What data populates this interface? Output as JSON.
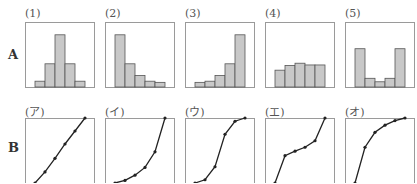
{
  "rows": [
    {
      "label": "A",
      "type": "histogram"
    },
    {
      "label": "B",
      "type": "line"
    }
  ],
  "colors": {
    "frame": "#9a9a9a",
    "bar_fill": "#c8c8c8",
    "bar_stroke": "#555555",
    "line": "#222222"
  },
  "chart_data": [
    {
      "type": "bar",
      "title": "(1)",
      "row": "A",
      "values": [
        1,
        4,
        9,
        4,
        1
      ],
      "ylim": [
        0,
        10
      ],
      "note": "symmetric, single peak"
    },
    {
      "type": "bar",
      "title": "(2)",
      "row": "A",
      "values": [
        9,
        4,
        2,
        1,
        0.8
      ],
      "ylim": [
        0,
        10
      ],
      "note": "right-skewed"
    },
    {
      "type": "bar",
      "title": "(3)",
      "row": "A",
      "values": [
        0.8,
        1,
        2,
        4,
        9
      ],
      "ylim": [
        0,
        10
      ],
      "note": "left-skewed"
    },
    {
      "type": "bar",
      "title": "(4)",
      "row": "A",
      "values": [
        2.9,
        3.7,
        4.1,
        3.8,
        3.8
      ],
      "ylim": [
        0,
        10
      ],
      "note": "roughly uniform"
    },
    {
      "type": "bar",
      "title": "(5)",
      "row": "A",
      "values": [
        6.6,
        1.5,
        0.9,
        1.5,
        6.6
      ],
      "ylim": [
        0,
        10
      ],
      "note": "bimodal U-shape"
    },
    {
      "type": "line",
      "title": "(ア)",
      "row": "B",
      "x": [
        0,
        1,
        2,
        3,
        4,
        5
      ],
      "y": [
        0,
        0.17,
        0.38,
        0.6,
        0.8,
        1.0
      ],
      "note": "linear cumulative"
    },
    {
      "type": "line",
      "title": "(イ)",
      "row": "B",
      "x": [
        0,
        1,
        2,
        3,
        4,
        5
      ],
      "y": [
        0,
        0.04,
        0.12,
        0.24,
        0.48,
        1.0
      ],
      "note": "convex cumulative"
    },
    {
      "type": "line",
      "title": "(ウ)",
      "row": "B",
      "x": [
        0,
        1,
        2,
        3,
        4,
        5
      ],
      "y": [
        0,
        0.05,
        0.25,
        0.75,
        0.95,
        1.0
      ],
      "note": "S-shaped cumulative"
    },
    {
      "type": "line",
      "title": "(エ)",
      "row": "B",
      "x": [
        0,
        1,
        2,
        3,
        4,
        5
      ],
      "y": [
        0,
        0.42,
        0.49,
        0.55,
        0.65,
        1.0
      ],
      "note": "inverse S cumulative"
    },
    {
      "type": "line",
      "title": "(オ)",
      "row": "B",
      "x": [
        0,
        1,
        2,
        3,
        4,
        5
      ],
      "y": [
        0,
        0.55,
        0.78,
        0.89,
        0.96,
        1.0
      ],
      "note": "concave cumulative"
    }
  ]
}
